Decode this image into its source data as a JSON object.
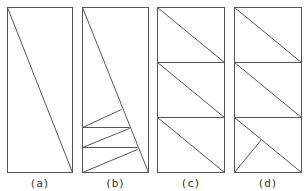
{
  "figure": {
    "stroke_color": "#555555",
    "panels": [
      {
        "label": "(a)",
        "rect": [
          7,
          7,
          72,
          172
        ],
        "lines": [
          [
            7,
            7,
            72,
            172
          ]
        ]
      },
      {
        "label": "(b)",
        "rect": [
          82,
          7,
          148,
          172
        ],
        "lines": [
          [
            82,
            7,
            148,
            172
          ],
          [
            82,
            127,
            121,
            109
          ],
          [
            82,
            127,
            129,
            127
          ],
          [
            82,
            147,
            129,
            128
          ],
          [
            82,
            147,
            137,
            147
          ],
          [
            82,
            172,
            137,
            149
          ]
        ]
      },
      {
        "label": "(c)",
        "rect": [
          157,
          7,
          224,
          172
        ],
        "lines": [
          [
            157,
            62,
            224,
            62
          ],
          [
            157,
            117,
            224,
            117
          ],
          [
            157,
            7,
            224,
            62
          ],
          [
            157,
            62,
            224,
            117
          ],
          [
            157,
            117,
            224,
            172
          ]
        ]
      },
      {
        "label": "(d)",
        "rect": [
          234,
          7,
          301,
          172
        ],
        "lines": [
          [
            234,
            62,
            301,
            62
          ],
          [
            234,
            117,
            301,
            117
          ],
          [
            234,
            7,
            301,
            62
          ],
          [
            234,
            62,
            301,
            117
          ],
          [
            234,
            117,
            301,
            172
          ],
          [
            234,
            172,
            261,
            139
          ]
        ]
      }
    ]
  }
}
